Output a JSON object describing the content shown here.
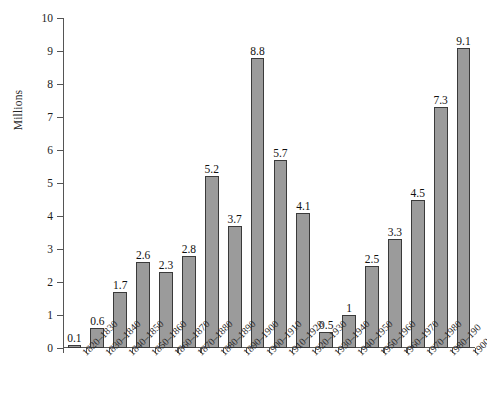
{
  "chart_data": {
    "type": "bar",
    "title": "",
    "subtitle": "",
    "xlabel": "",
    "ylabel": "Millions",
    "ylim": [
      0,
      10
    ],
    "ytick_values": [
      0,
      1,
      2,
      3,
      4,
      5,
      6,
      7,
      8,
      9,
      10
    ],
    "ytick_labels": [
      "0",
      "1",
      "2",
      "3",
      "4",
      "5",
      "6",
      "7",
      "8",
      "9",
      "10"
    ],
    "grid": false,
    "legend": false,
    "legend_position": "none",
    "bar_color": "#9b9b9b",
    "bar_edge_color": "#3a3a3a",
    "axis_color": "#555555",
    "text_color": "#1c1c1c",
    "categories": [
      "1820–1830",
      "1830–1840",
      "1840–1850",
      "1850–1860",
      "1860–1870",
      "1870–1880",
      "1880–1890",
      "1890–1900",
      "1900–1910",
      "1910–1920",
      "1920–1930",
      "1930–1940",
      "1940–1950",
      "1950–1960",
      "1960–1970",
      "1970–1980",
      "1980–190",
      "1900–2000"
    ],
    "values": [
      0.1,
      0.6,
      1.7,
      2.6,
      2.3,
      2.8,
      5.2,
      3.7,
      8.8,
      5.7,
      4.1,
      0.5,
      1,
      2.5,
      3.3,
      4.5,
      7.3,
      9.1
    ],
    "value_labels": [
      "0.1",
      "0.6",
      "1.7",
      "2.6",
      "2.3",
      "2.8",
      "5.2",
      "3.7",
      "8.8",
      "5.7",
      "4.1",
      "0.5",
      "1",
      "2.5",
      "3.3",
      "4.5",
      "7.3",
      "9.1"
    ]
  }
}
